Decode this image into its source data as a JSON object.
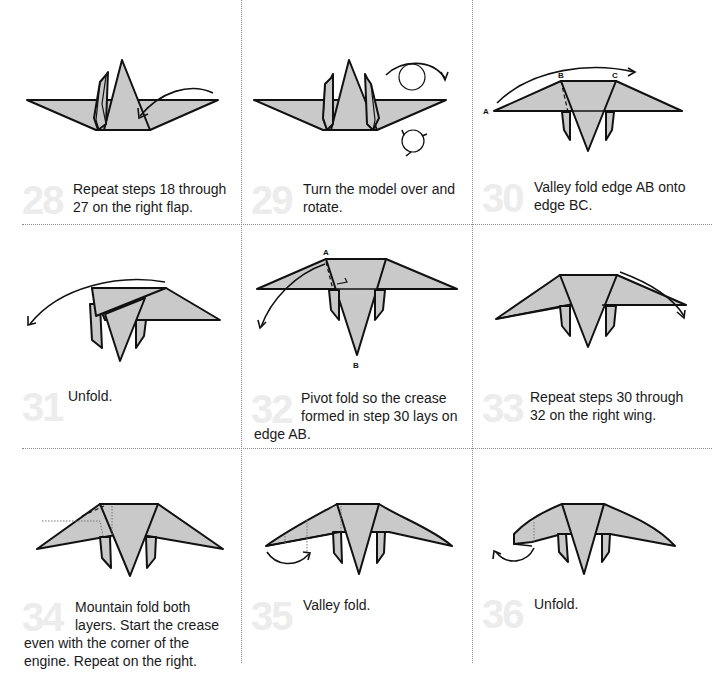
{
  "page": {
    "colors": {
      "paper_fill": "#c9c9c9",
      "outline": "#111111",
      "step_number": "#ececec",
      "divider": "#8a8a8a",
      "text": "#1a1a1a"
    }
  },
  "steps": [
    {
      "number": "28",
      "text": "Repeat steps 18 through 27 on the right flap.",
      "lines": [
        "Repeat steps 18 through",
        "27 on the right flap."
      ],
      "labels": []
    },
    {
      "number": "29",
      "text": "Turn the model over and rotate.",
      "lines": [
        "Turn the model over and",
        "rotate."
      ],
      "labels": []
    },
    {
      "number": "30",
      "text": "Valley fold edge AB onto edge BC.",
      "lines": [
        "Valley fold edge AB onto",
        "edge BC."
      ],
      "labels": [
        "A",
        "B",
        "C"
      ]
    },
    {
      "number": "31",
      "text": "Unfold.",
      "lines": [
        "Unfold."
      ],
      "labels": []
    },
    {
      "number": "32",
      "text": "Pivot fold so the crease formed in step 30 lays on edge AB.",
      "lines": [
        "Pivot fold so the crease",
        "formed in step 30 lays on",
        "edge AB."
      ],
      "labels": [
        "A",
        "B"
      ]
    },
    {
      "number": "33",
      "text": "Repeat steps 30 through 32 on the right wing.",
      "lines": [
        "Repeat steps 30 through",
        "32 on the right wing."
      ],
      "labels": []
    },
    {
      "number": "34",
      "text": "Mountain fold both layers. Start the crease even with the corner of the engine. Repeat on the right.",
      "lines": [
        "Mountain fold both",
        "layers. Start the crease",
        "even with the corner of the",
        "engine. Repeat on the right."
      ],
      "labels": []
    },
    {
      "number": "35",
      "text": "Valley fold.",
      "lines": [
        "Valley fold."
      ],
      "labels": []
    },
    {
      "number": "36",
      "text": "Unfold.",
      "lines": [
        "Unfold."
      ],
      "labels": []
    }
  ]
}
